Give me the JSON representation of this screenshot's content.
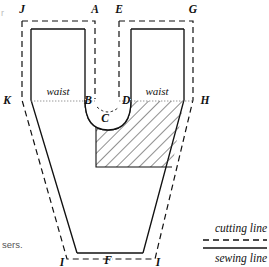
{
  "diagram": {
    "colors": {
      "line": "#111111",
      "hatch": "#333333",
      "background": "#ffffff",
      "dotted_guide": "#999999"
    },
    "point_labels": [
      {
        "id": "J",
        "text": "J",
        "x": 22,
        "y": 13
      },
      {
        "id": "A",
        "text": "A",
        "x": 95,
        "y": 13
      },
      {
        "id": "E",
        "text": "E",
        "x": 119,
        "y": 13
      },
      {
        "id": "G",
        "text": "G",
        "x": 193,
        "y": 13
      },
      {
        "id": "K",
        "text": "K",
        "x": 7,
        "y": 104
      },
      {
        "id": "B",
        "text": "B",
        "x": 92,
        "y": 104
      },
      {
        "id": "D",
        "text": "D",
        "x": 122,
        "y": 104
      },
      {
        "id": "H",
        "text": "H",
        "x": 205,
        "y": 104
      },
      {
        "id": "C",
        "text": "C",
        "x": 103,
        "y": 120
      },
      {
        "id": "I1",
        "text": "I",
        "x": 60,
        "y": 265
      },
      {
        "id": "F",
        "text": "F",
        "x": 108,
        "y": 263
      },
      {
        "id": "I2",
        "text": "I",
        "x": 156,
        "y": 265
      }
    ],
    "region_labels": [
      {
        "id": "waist-left",
        "text": "waist",
        "x": 44,
        "y": 94
      },
      {
        "id": "waist-right",
        "text": "waist",
        "x": 142,
        "y": 94
      }
    ],
    "legend": {
      "cutting_line_label": "cutting line",
      "sewing_line_label": "sewing line"
    },
    "caption_fragment": "sers.",
    "edge_fragment": "r"
  }
}
